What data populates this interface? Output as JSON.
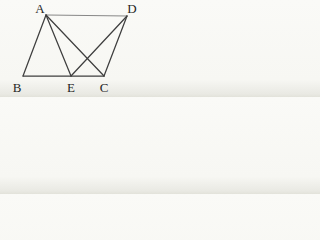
{
  "figure": {
    "background_color": "#f8f8f4",
    "line_color": "#3f3f3f",
    "thin_line_color": "#6a6a6a",
    "label_color": "#262626",
    "width": 145,
    "height": 97,
    "points": [
      {
        "id": "A",
        "label": "A",
        "x": 46,
        "y": 15,
        "label_x": 40,
        "label_y": 13
      },
      {
        "id": "D",
        "label": "D",
        "x": 127,
        "y": 16,
        "label_x": 132,
        "label_y": 13
      },
      {
        "id": "B",
        "label": "B",
        "x": 23,
        "y": 76,
        "label_x": 17,
        "label_y": 92
      },
      {
        "id": "E",
        "label": "E",
        "x": 71,
        "y": 76,
        "label_x": 71,
        "label_y": 92
      },
      {
        "id": "C",
        "label": "C",
        "x": 104,
        "y": 76,
        "label_x": 104,
        "label_y": 92
      }
    ],
    "edges": [
      {
        "from": "A",
        "to": "D",
        "thin": true
      },
      {
        "from": "A",
        "to": "B",
        "thin": false
      },
      {
        "from": "B",
        "to": "C",
        "thin": false
      },
      {
        "from": "D",
        "to": "C",
        "thin": false
      },
      {
        "from": "A",
        "to": "E",
        "thin": false
      },
      {
        "from": "A",
        "to": "C",
        "thin": false
      },
      {
        "from": "D",
        "to": "E",
        "thin": false
      }
    ]
  }
}
